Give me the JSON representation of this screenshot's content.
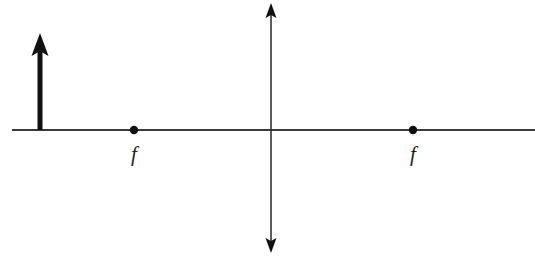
{
  "diagram": {
    "type": "thin-lens ray diagram",
    "colors": {
      "background": "#ffffff",
      "line": "#333333",
      "object": "#111111"
    },
    "optical_axis": {
      "y": 130,
      "x_start": 12,
      "x_end": 535
    },
    "lens": {
      "kind": "converging",
      "x": 271,
      "y_top": 3,
      "y_bottom": 253
    },
    "object_arrow": {
      "x": 40,
      "y_base": 130,
      "y_tip": 33
    },
    "focal_points": [
      {
        "x": 134,
        "label": "f"
      },
      {
        "x": 413,
        "label": "f"
      }
    ]
  }
}
